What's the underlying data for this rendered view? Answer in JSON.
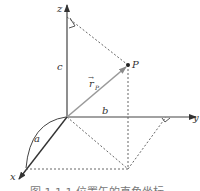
{
  "diagram": {
    "type": "3d-coordinate-system",
    "axes": {
      "x": "x",
      "y": "y",
      "z": "z"
    },
    "point": {
      "label": "P"
    },
    "vector": {
      "label": "r",
      "subscript": "P",
      "arrow": "→"
    },
    "components": {
      "a": "a",
      "b": "b",
      "c": "c"
    },
    "caption": "图 1.1.1 位置矢的直角坐标"
  },
  "colors": {
    "axis": "#444444",
    "vector": "#9a9a9a",
    "dashed": "#555555",
    "text": "#333333"
  }
}
